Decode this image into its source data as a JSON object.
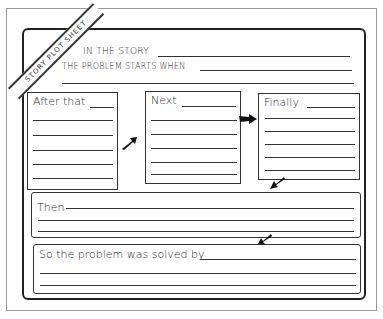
{
  "worksheet": {
    "banner": "STORY PLOT SHEET",
    "intro": {
      "line1": "IN THE STORY",
      "line2": "THE PROBLEM STARTS WHEN"
    },
    "boxes": [
      {
        "label": "After that"
      },
      {
        "label": "Next"
      },
      {
        "label": "Finally"
      }
    ],
    "then": {
      "label": "Then"
    },
    "solved": {
      "label": "So the problem was solved by"
    },
    "colors": {
      "ink": "#222222",
      "frame": "#999999",
      "background": "#ffffff"
    }
  }
}
